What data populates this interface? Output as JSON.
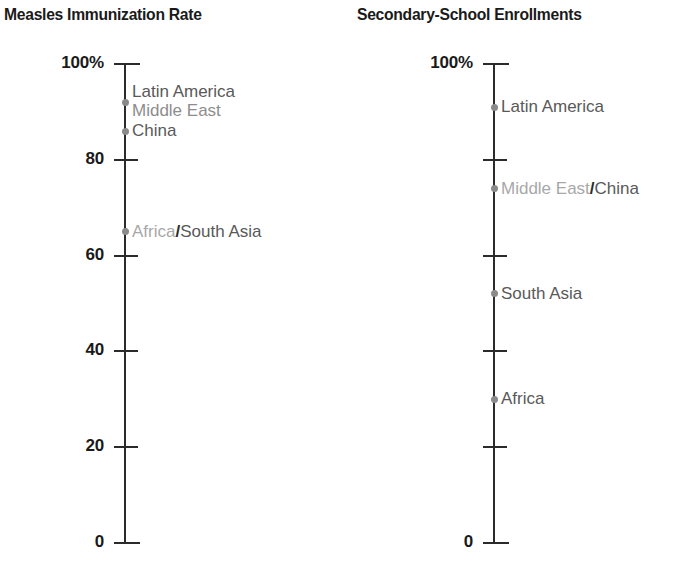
{
  "figure": {
    "background": "#ffffff",
    "accent_dot_color": "#8a8a8a",
    "axis_color": "#2b2b2b",
    "label_gray": "#8d8d8d",
    "label_dark_gray": "#595959"
  },
  "charts": {
    "left": {
      "title": "Measles Immunization Rate",
      "axis": {
        "ticks": [
          {
            "value": 100,
            "label": "100%"
          },
          {
            "value": 80,
            "label": "80"
          },
          {
            "value": 60,
            "label": "60"
          },
          {
            "value": 40,
            "label": "40"
          },
          {
            "value": 20,
            "label": "20"
          },
          {
            "value": 0,
            "label": "0"
          }
        ]
      },
      "points": [
        {
          "label": "Latin America",
          "value": 92
        },
        {
          "label": "Middle East",
          "value": 92
        },
        {
          "label": "China",
          "value": 86
        },
        {
          "label": "Africa/South Asia",
          "value": 65
        }
      ]
    },
    "right": {
      "title": "Secondary-School Enrollments",
      "axis": {
        "ticks": [
          {
            "value": 100,
            "label": "100%"
          },
          {
            "value": 80,
            "label": ""
          },
          {
            "value": 60,
            "label": ""
          },
          {
            "value": 40,
            "label": ""
          },
          {
            "value": 20,
            "label": ""
          },
          {
            "value": 0,
            "label": "0"
          }
        ]
      },
      "points": [
        {
          "label": "Latin America",
          "value": 91
        },
        {
          "label": "Middle East/China",
          "value": 74
        },
        {
          "label": "South Asia",
          "value": 52
        },
        {
          "label": "Africa",
          "value": 30
        }
      ]
    }
  },
  "chart_data": [
    {
      "type": "scatter",
      "title": "Measles Immunization Rate",
      "xlabel": "",
      "ylabel": "",
      "ylim": [
        0,
        100
      ],
      "yticks": [
        0,
        20,
        40,
        60,
        80,
        100
      ],
      "ytick_labels": [
        "0",
        "20",
        "40",
        "60",
        "80",
        "100%"
      ],
      "grid": false,
      "legend": "none",
      "categories": [
        "Latin America",
        "Middle East",
        "China",
        "Africa/South Asia"
      ],
      "values": [
        92,
        92,
        86,
        65
      ],
      "annotations": [
        "Latin America and Middle East share a single marker at ~92%",
        "Africa and South Asia share a single marker at ~65%"
      ]
    },
    {
      "type": "scatter",
      "title": "Secondary-School Enrollments",
      "xlabel": "",
      "ylabel": "",
      "ylim": [
        0,
        100
      ],
      "yticks": [
        0,
        20,
        40,
        60,
        80,
        100
      ],
      "ytick_labels": [
        "0",
        "",
        "",
        "",
        "",
        "100%"
      ],
      "grid": false,
      "legend": "none",
      "categories": [
        "Latin America",
        "Middle East/China",
        "South Asia",
        "Africa"
      ],
      "values": [
        91,
        74,
        52,
        30
      ],
      "annotations": [
        "Middle East and China share a single marker at ~74%"
      ]
    }
  ]
}
